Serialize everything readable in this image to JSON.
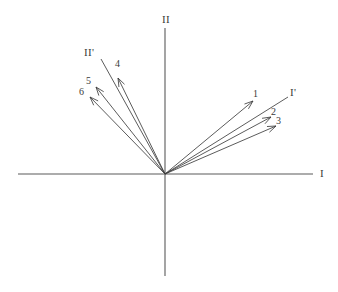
{
  "figure": {
    "background_color": "#ffffff",
    "line_color": "#3d3d3d",
    "axis_color": "#5a5a5a",
    "origin": {
      "x": 165,
      "y": 174
    }
  },
  "axes": [
    {
      "id": "axis-I",
      "label": "I",
      "kind": "horizontal",
      "x1": 18,
      "y1": 174,
      "x2": 313,
      "y2": 174,
      "label_x": 320,
      "label_y": 168
    },
    {
      "id": "axis-II",
      "label": "II",
      "kind": "vertical",
      "x1": 165,
      "y1": 28,
      "x2": 165,
      "y2": 276,
      "label_x": 162,
      "label_y": 14
    }
  ],
  "prime_axes": [
    {
      "id": "axis-I-prime",
      "label": "I'",
      "x1": 165,
      "y1": 174,
      "x2": 288,
      "y2": 97,
      "label_x": 290,
      "label_y": 87
    },
    {
      "id": "axis-II-prime",
      "label": "II'",
      "x1": 165,
      "y1": 174,
      "x2": 101,
      "y2": 59,
      "label_x": 84,
      "label_y": 47
    }
  ],
  "vectors": [
    {
      "id": "vector-1",
      "label": "1",
      "x1": 165,
      "y1": 174,
      "x2": 253,
      "y2": 101,
      "label_x": 253,
      "label_y": 89
    },
    {
      "id": "vector-2",
      "label": "2",
      "x1": 165,
      "y1": 174,
      "x2": 271,
      "y2": 117,
      "label_x": 271,
      "label_y": 107
    },
    {
      "id": "vector-3",
      "label": "3",
      "x1": 165,
      "y1": 174,
      "x2": 276,
      "y2": 126,
      "label_x": 276,
      "label_y": 116
    },
    {
      "id": "vector-4",
      "label": "4",
      "x1": 165,
      "y1": 174,
      "x2": 118,
      "y2": 78,
      "label_x": 115,
      "label_y": 59
    },
    {
      "id": "vector-5",
      "label": "5",
      "x1": 165,
      "y1": 174,
      "x2": 96,
      "y2": 87,
      "label_x": 86,
      "label_y": 76
    },
    {
      "id": "vector-6",
      "label": "6",
      "x1": 165,
      "y1": 174,
      "x2": 90,
      "y2": 97,
      "label_x": 79,
      "label_y": 87
    }
  ],
  "chart_data": {
    "type": "scatter",
    "xlabel": "I",
    "ylabel": "II",
    "grid": false,
    "legend": null,
    "xlim": [
      -147,
      148
    ],
    "ylim": [
      -102,
      146
    ],
    "axes_labels": [
      "I",
      "II"
    ],
    "rotated_axes_labels": [
      "I'",
      "II'"
    ],
    "annotations": [
      "I",
      "II",
      "I'",
      "II'",
      "1",
      "2",
      "3",
      "4",
      "5",
      "6"
    ],
    "note": "All vectors originate at the origin (0,0); lengths and angles measured in pixel units from origin at (165,174).",
    "series": [
      {
        "name": "vectors",
        "points": [
          {
            "label": "1",
            "dx": 88,
            "dy": 73,
            "length": 114.3,
            "angle_deg": 39.7
          },
          {
            "label": "2",
            "dx": 106,
            "dy": 57,
            "length": 120.4,
            "angle_deg": 28.3
          },
          {
            "label": "3",
            "dx": 111,
            "dy": 48,
            "length": 120.9,
            "angle_deg": 23.4
          },
          {
            "label": "4",
            "dx": -47,
            "dy": 96,
            "length": 106.9,
            "angle_deg": 116.1
          },
          {
            "label": "5",
            "dx": -69,
            "dy": 87,
            "length": 111.0,
            "angle_deg": 128.4
          },
          {
            "label": "6",
            "dx": -75,
            "dy": 77,
            "length": 107.5,
            "angle_deg": 134.2
          }
        ]
      },
      {
        "name": "rotated_axes",
        "points": [
          {
            "label": "I'",
            "dx": 123,
            "dy": 77,
            "length": 145.1,
            "angle_deg": 32.0
          },
          {
            "label": "II'",
            "dx": -64,
            "dy": 115,
            "length": 131.6,
            "angle_deg": 119.1
          }
        ]
      }
    ]
  }
}
